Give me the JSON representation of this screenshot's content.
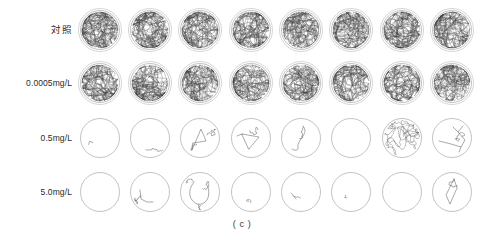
{
  "figure": {
    "caption": "( c )",
    "caption_y": 219,
    "arena": {
      "radius": 19.5,
      "outer_radius": 21.5,
      "cell_size": 44
    },
    "columns": 8,
    "column_centers": [
      100,
      150,
      200,
      251,
      301,
      351,
      402,
      452
    ],
    "row_centers": [
      30,
      83,
      138,
      192
    ],
    "colors": {
      "arena_stroke": "#9b9b9b",
      "arena_outer_stroke": "#b4b4b4",
      "track_dense": "#3c3c3c",
      "track_sparse": "#5a5a5a",
      "label_text": "#2b2b2b",
      "caption_text": "#3a3a3a",
      "background": "#ffffff"
    }
  },
  "rows": [
    {
      "label": "対照",
      "label_is_cjk": true,
      "density": "dense",
      "replicates": [
        {
          "index": 1,
          "activity": "very-high",
          "seed": 11,
          "segments": 520,
          "step": 7.0,
          "has_center_gap": false
        },
        {
          "index": 2,
          "activity": "high",
          "seed": 22,
          "segments": 470,
          "step": 7.6,
          "has_center_gap": false
        },
        {
          "index": 3,
          "activity": "high",
          "seed": 33,
          "segments": 480,
          "step": 7.2,
          "has_center_gap": false
        },
        {
          "index": 4,
          "activity": "high",
          "seed": 44,
          "segments": 460,
          "step": 7.4,
          "has_center_gap": false
        },
        {
          "index": 5,
          "activity": "high",
          "seed": 55,
          "segments": 470,
          "step": 7.1,
          "has_center_gap": true
        },
        {
          "index": 6,
          "activity": "high",
          "seed": 66,
          "segments": 455,
          "step": 7.5,
          "has_center_gap": false
        },
        {
          "index": 7,
          "activity": "very-high",
          "seed": 77,
          "segments": 500,
          "step": 7.0,
          "has_center_gap": true
        },
        {
          "index": 8,
          "activity": "high",
          "seed": 88,
          "segments": 475,
          "step": 7.3,
          "has_center_gap": false
        }
      ]
    },
    {
      "label": "0.0005mg/L",
      "label_is_cjk": false,
      "density": "dense",
      "replicates": [
        {
          "index": 1,
          "activity": "high",
          "seed": 91,
          "segments": 450,
          "step": 7.2,
          "has_center_gap": true
        },
        {
          "index": 2,
          "activity": "high",
          "seed": 102,
          "segments": 430,
          "step": 7.5,
          "has_center_gap": true
        },
        {
          "index": 3,
          "activity": "high",
          "seed": 113,
          "segments": 440,
          "step": 7.3,
          "has_center_gap": true
        },
        {
          "index": 4,
          "activity": "high",
          "seed": 124,
          "segments": 455,
          "step": 7.1,
          "has_center_gap": false
        },
        {
          "index": 5,
          "activity": "high",
          "seed": 135,
          "segments": 425,
          "step": 7.6,
          "has_center_gap": true
        },
        {
          "index": 6,
          "activity": "medium",
          "seed": 146,
          "segments": 400,
          "step": 7.8,
          "has_center_gap": true
        },
        {
          "index": 7,
          "activity": "high",
          "seed": 157,
          "segments": 445,
          "step": 7.2,
          "has_center_gap": true
        },
        {
          "index": 8,
          "activity": "high",
          "seed": 168,
          "segments": 435,
          "step": 7.4,
          "has_center_gap": false
        }
      ]
    },
    {
      "label": "0.5mg/L",
      "label_is_cjk": false,
      "density": "sparse",
      "replicates": [
        {
          "index": 1,
          "activity": "none",
          "seed": 201,
          "pattern": "tiny-mark-lower-left"
        },
        {
          "index": 2,
          "activity": "very-low",
          "seed": 212,
          "pattern": "small-blot-bottom"
        },
        {
          "index": 3,
          "activity": "low",
          "seed": 223,
          "pattern": "triangle-loop-center"
        },
        {
          "index": 4,
          "activity": "low",
          "seed": 234,
          "pattern": "open-triangle-path"
        },
        {
          "index": 5,
          "activity": "low",
          "seed": 245,
          "pattern": "hook-curve-down"
        },
        {
          "index": 6,
          "activity": "none",
          "seed": 256,
          "pattern": "empty"
        },
        {
          "index": 7,
          "activity": "medium",
          "seed": 267,
          "pattern": "dense-ball-center"
        },
        {
          "index": 8,
          "activity": "low",
          "seed": 278,
          "pattern": "branching-right-edge"
        }
      ]
    },
    {
      "label": "5.0mg/L",
      "label_is_cjk": false,
      "density": "sparse",
      "replicates": [
        {
          "index": 1,
          "activity": "none",
          "seed": 301,
          "pattern": "empty"
        },
        {
          "index": 2,
          "activity": "very-low",
          "seed": 312,
          "pattern": "short-streak-lower-left"
        },
        {
          "index": 3,
          "activity": "low",
          "seed": 323,
          "pattern": "wide-arc-loop"
        },
        {
          "index": 4,
          "activity": "very-low",
          "seed": 334,
          "pattern": "tiny-smudge-bottom"
        },
        {
          "index": 5,
          "activity": "very-low",
          "seed": 345,
          "pattern": "short-dash-left"
        },
        {
          "index": 6,
          "activity": "very-low",
          "seed": 356,
          "pattern": "dot-center-left"
        },
        {
          "index": 7,
          "activity": "none",
          "seed": 367,
          "pattern": "empty"
        },
        {
          "index": 8,
          "activity": "low",
          "seed": 378,
          "pattern": "narrow-vertical-loop"
        }
      ]
    }
  ]
}
